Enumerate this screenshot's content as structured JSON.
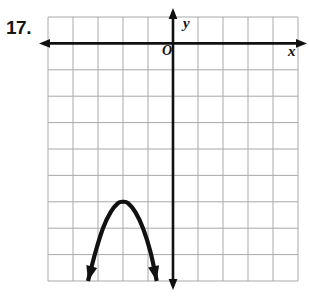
{
  "figure": {
    "problem_number": "17.",
    "labels": {
      "y_axis": "y",
      "x_axis": "x",
      "origin": "O"
    },
    "colors": {
      "gridline": "#a9a9ad",
      "axis": "#111111",
      "curve": "#111111",
      "background": "#ffffff",
      "text": "#151515"
    }
  },
  "chart_data": {
    "type": "line",
    "title": "",
    "subtitle": "",
    "xlabel": "x",
    "ylabel": "y",
    "grid": true,
    "legend": null,
    "grid_cells_x": 10,
    "grid_cells_y": 10,
    "origin_cell": {
      "col": 5,
      "row": 1
    },
    "xlim": [
      -5,
      5
    ],
    "ylim": [
      -9,
      1
    ],
    "axis_arrows": {
      "x_left": true,
      "x_right": true,
      "y_up": true,
      "y_down": true
    },
    "curve": {
      "name": "parabola",
      "opens": "down",
      "vertex": [
        -2,
        -6
      ],
      "x_intercepts": [],
      "points": [
        [
          -3.4,
          -9.0
        ],
        [
          -3.1,
          -7.9
        ],
        [
          -2.8,
          -7.0
        ],
        [
          -2.5,
          -6.4
        ],
        [
          -2.2,
          -6.05
        ],
        [
          -2.0,
          -6.0
        ],
        [
          -1.8,
          -6.05
        ],
        [
          -1.5,
          -6.4
        ],
        [
          -1.2,
          -7.0
        ],
        [
          -0.9,
          -7.9
        ],
        [
          -0.65,
          -9.0
        ]
      ],
      "endpoints_have_arrows": true
    }
  }
}
